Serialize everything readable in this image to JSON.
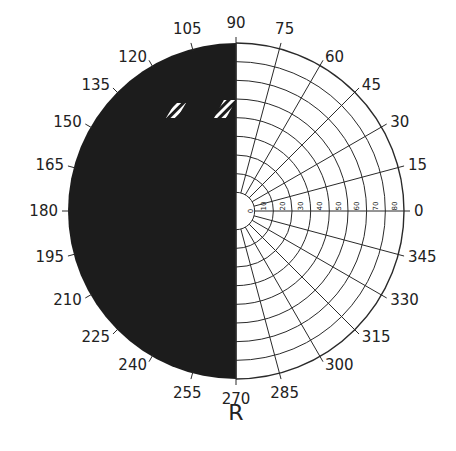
{
  "diagram": {
    "type": "visual-field-perimetry-chart",
    "eye_label": "R",
    "center": [
      236,
      211
    ],
    "outer_radius": 168,
    "colors": {
      "background": "#ffffff",
      "grid": "#2a2a2a",
      "scotoma_fill": "#1c1c1c",
      "text": "#222222",
      "hatch": "#ffffff"
    },
    "angle_labels": [
      {
        "deg": 0,
        "text": "0"
      },
      {
        "deg": 15,
        "text": "15"
      },
      {
        "deg": 30,
        "text": "30"
      },
      {
        "deg": 45,
        "text": "45"
      },
      {
        "deg": 60,
        "text": "60"
      },
      {
        "deg": 75,
        "text": "75"
      },
      {
        "deg": 90,
        "text": "90"
      },
      {
        "deg": 105,
        "text": "105"
      },
      {
        "deg": 120,
        "text": "120"
      },
      {
        "deg": 135,
        "text": "135"
      },
      {
        "deg": 150,
        "text": "150"
      },
      {
        "deg": 165,
        "text": "165"
      },
      {
        "deg": 180,
        "text": "180"
      },
      {
        "deg": 195,
        "text": "195"
      },
      {
        "deg": 210,
        "text": "210"
      },
      {
        "deg": 225,
        "text": "225"
      },
      {
        "deg": 240,
        "text": "240"
      },
      {
        "deg": 255,
        "text": "255"
      },
      {
        "deg": 270,
        "text": "270"
      },
      {
        "deg": 285,
        "text": "285"
      },
      {
        "deg": 300,
        "text": "300"
      },
      {
        "deg": 315,
        "text": "315"
      },
      {
        "deg": 330,
        "text": "330"
      },
      {
        "deg": 345,
        "text": "345"
      }
    ],
    "radial_labels": [
      "10",
      "20",
      "30",
      "40",
      "50",
      "60",
      "70",
      "80"
    ],
    "center_label": "0",
    "rings_deg": [
      10,
      20,
      30,
      40,
      50,
      60,
      70,
      80,
      90
    ],
    "meridian_step_deg": 15,
    "scotoma": {
      "description": "Left hemifield (90° to 270°) completely filled dark — homonymous hemianopia",
      "from_deg": 90,
      "to_deg": 270
    },
    "hatched_patches": [
      {
        "x": 166,
        "y": 103,
        "w": 20,
        "h": 15
      },
      {
        "x": 214,
        "y": 100,
        "w": 22,
        "h": 18
      }
    ]
  }
}
